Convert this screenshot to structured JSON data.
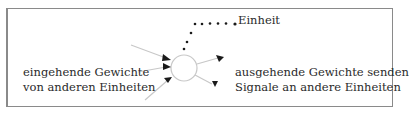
{
  "diagram": {
    "unit_label": "Einheit",
    "incoming_label": [
      "eingehende Gewichte",
      "von anderen Einheiten"
    ],
    "outgoing_label": [
      "ausgehende Gewichte senden",
      "Signale an andere Einheiten"
    ],
    "colors": {
      "border": "#8a8a8a",
      "line": "#c8c8c8",
      "arrowhead": "#1a1a1a",
      "dot": "#1a1a1a",
      "text": "#2a2a2a"
    }
  }
}
